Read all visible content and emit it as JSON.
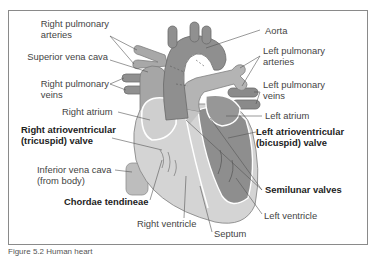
{
  "figure": {
    "caption": "Figure 5.2  Human heart",
    "colors": {
      "frame": "#8a8a8a",
      "vessel": "#9a9a9a",
      "vessel_dark": "#7d7d7d",
      "chamber_light": "#d6d6d6",
      "chamber_dark": "#8c8c8c",
      "outline": "#ffffff",
      "label_text": "#444444",
      "leader_line": "#555555"
    }
  },
  "labels": {
    "left_side": [
      {
        "id": "right-pulmonary-arteries",
        "text_line1": "Right pulmonary",
        "text_line2": "arteries",
        "bold": false
      },
      {
        "id": "superior-vena-cava",
        "text_line1": "Superior vena cava",
        "bold": false
      },
      {
        "id": "right-pulmonary-veins",
        "text_line1": "Right pulmonary",
        "text_line2": "veins",
        "bold": false
      },
      {
        "id": "right-atrium",
        "text_line1": "Right atrium",
        "bold": false
      },
      {
        "id": "right-av-valve",
        "text_line1": "Right atrioventricular",
        "text_line2": "(tricuspid) valve",
        "bold": true
      },
      {
        "id": "inferior-vena-cava",
        "text_line1": "Inferior vena cava",
        "text_line2": "(from body)",
        "bold": false
      },
      {
        "id": "chordae-tendineae",
        "text_line1": "Chordae tendineae",
        "bold": true
      }
    ],
    "right_side": [
      {
        "id": "aorta",
        "text_line1": "Aorta",
        "bold": false
      },
      {
        "id": "left-pulmonary-arteries",
        "text_line1": "Left pulmonary",
        "text_line2": "arteries",
        "bold": false
      },
      {
        "id": "left-pulmonary-veins",
        "text_line1": "Left pulmonary",
        "text_line2": "veins",
        "bold": false
      },
      {
        "id": "left-atrium",
        "text_line1": "Left atrium",
        "bold": false
      },
      {
        "id": "left-av-valve",
        "text_line1": "Left atrioventricular",
        "text_line2": "(bicuspid) valve",
        "bold": true
      },
      {
        "id": "semilunar-valves",
        "text_line1": "Semilunar valves",
        "bold": true
      },
      {
        "id": "left-ventricle",
        "text_line1": "Left ventricle",
        "bold": false
      }
    ],
    "bottom": [
      {
        "id": "right-ventricle",
        "text_line1": "Right ventricle",
        "bold": false
      },
      {
        "id": "septum",
        "text_line1": "Septum",
        "bold": false
      }
    ]
  }
}
